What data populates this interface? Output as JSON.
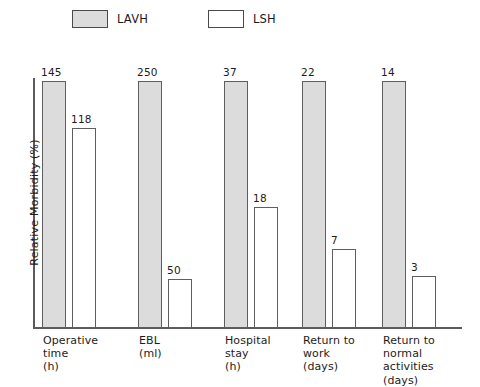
{
  "chart_data": {
    "type": "bar",
    "title": "",
    "subtitle": "",
    "xlabel": "",
    "ylabel": "Relative Morbidity (%)",
    "ylim": [
      0,
      100
    ],
    "grid": false,
    "legend_position": "top",
    "categories": [
      "Operative time (h)",
      "EBL (ml)",
      "Hospital stay (h)",
      "Return to work (days)",
      "Return to normal activities (days)"
    ],
    "category_lines": [
      [
        "Operative",
        "time",
        "(h)"
      ],
      [
        "EBL",
        "(ml)"
      ],
      [
        "Hospital",
        "stay",
        "(h)"
      ],
      [
        "Return to",
        "work",
        "(days)"
      ],
      [
        "Return to",
        "normal",
        "activities",
        "(days)"
      ]
    ],
    "series": [
      {
        "name": "LAVH",
        "color": "#dcdcdc",
        "values": [
          145,
          250,
          37,
          22,
          14
        ],
        "relative_heights": [
          100,
          100,
          100,
          100,
          100
        ]
      },
      {
        "name": "LSH",
        "color": "#ffffff",
        "values": [
          118,
          50,
          18,
          7,
          3
        ],
        "relative_heights": [
          81,
          20,
          49,
          32,
          21
        ]
      }
    ]
  },
  "legend": {
    "items": [
      {
        "label": "LAVH",
        "swatch": "fill-gray"
      },
      {
        "label": "LSH",
        "swatch": "fill-white"
      }
    ]
  },
  "axes": {
    "y_title": "Relative Morbidity (%)"
  }
}
